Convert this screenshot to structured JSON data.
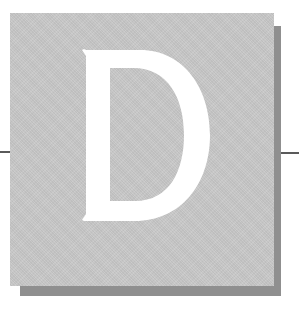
{
  "drop_cap": {
    "letter": "D",
    "tile_color": "#c8c8c8",
    "shadow_color": "#8f8f8f",
    "letter_color": "#ffffff",
    "rule_color": "#5a5a5a"
  }
}
